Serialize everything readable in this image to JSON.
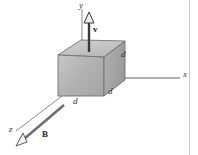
{
  "figure": {
    "background_color": "#ffffff",
    "border_color": "#c9c9c9"
  },
  "axes": [
    {
      "id": "y",
      "label": "y",
      "direction": "up",
      "x": 81,
      "y": 3
    },
    {
      "id": "x",
      "label": "x",
      "direction": "right",
      "x": 183,
      "y": 73
    },
    {
      "id": "z",
      "label": "z",
      "direction": "down-left",
      "x": 10,
      "y": 126
    }
  ],
  "vectors": [
    {
      "id": "v",
      "label": "v",
      "description": "velocity-vector",
      "direction": "up",
      "x": 92,
      "y": 29
    },
    {
      "id": "B",
      "label": "B",
      "description": "magnetic-field-vector",
      "direction": "down-left",
      "x": 41,
      "y": 134
    }
  ],
  "cube": {
    "label": "cube",
    "fill_front": "#b4b4b4",
    "fill_top": "#c6c6c6",
    "fill_right": "#a5a5a5",
    "edge_color": "#6d6d6d",
    "edge_labels": [
      {
        "id": "d-right",
        "label": "d",
        "x": 122,
        "y": 54
      },
      {
        "id": "d-bottom-right",
        "label": "d",
        "x": 109,
        "y": 91
      },
      {
        "id": "d-bottom-front",
        "label": "d",
        "x": 74,
        "y": 100
      }
    ]
  },
  "colors": {
    "line": "#555555",
    "text": "#2e2e2e",
    "arrow_fill": "#8e8e8e"
  }
}
